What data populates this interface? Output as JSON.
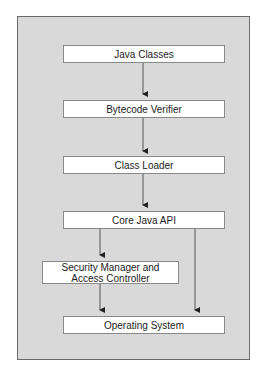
{
  "diagram": {
    "nodes": [
      {
        "id": "java-classes",
        "label": "Java Classes"
      },
      {
        "id": "bytecode-verifier",
        "label": "Bytecode Verifier"
      },
      {
        "id": "class-loader",
        "label": "Class Loader"
      },
      {
        "id": "core-java-api",
        "label": "Core Java API"
      },
      {
        "id": "security-manager",
        "label": "Security Manager and Access Controller"
      },
      {
        "id": "operating-system",
        "label": "Operating System"
      }
    ],
    "edges": [
      {
        "from": "java-classes",
        "to": "bytecode-verifier"
      },
      {
        "from": "bytecode-verifier",
        "to": "class-loader"
      },
      {
        "from": "class-loader",
        "to": "core-java-api"
      },
      {
        "from": "core-java-api",
        "to": "security-manager"
      },
      {
        "from": "core-java-api",
        "to": "operating-system"
      },
      {
        "from": "security-manager",
        "to": "operating-system"
      }
    ],
    "colors": {
      "panel_background": "#d9d9d9",
      "box_background": "#ffffff",
      "line": "#333333"
    }
  }
}
